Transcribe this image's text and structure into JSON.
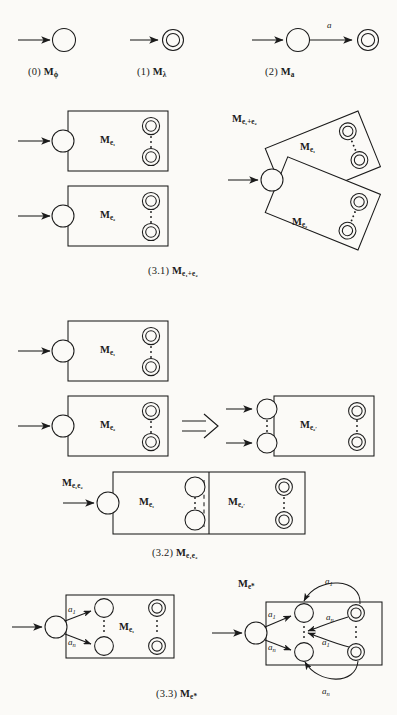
{
  "figure": {
    "ink_color": "#1b1b1b",
    "paper_color": "#fbfaf7"
  },
  "row_base": {
    "items": [
      {
        "index": "(0)",
        "machine": "M",
        "sub": "ϕ",
        "caption_full": "(0) Mϕ"
      },
      {
        "index": "(1)",
        "machine": "M",
        "sub": "λ",
        "caption_full": "(1) Mλ"
      },
      {
        "index": "(2)",
        "machine": "M",
        "sub": "a",
        "caption_full": "(2) Ma",
        "edge_label": "a"
      }
    ]
  },
  "union": {
    "caption_index": "(3.1)",
    "caption_machine": "M",
    "caption_sub": "e₁+e₂",
    "left_box_1_label": "M",
    "left_box_1_sub": "e₁",
    "left_box_2_label": "M",
    "left_box_2_sub": "e₂",
    "result_outer_label": "M",
    "result_outer_sub": "e₁+e₂",
    "result_box_1_label": "M",
    "result_box_1_sub": "e₁",
    "result_box_2_label": "M",
    "result_box_2_sub": "e₂"
  },
  "concat": {
    "caption_index": "(3.2)",
    "caption_machine": "M",
    "caption_sub": "e₁e₂",
    "src_box_1_label": "M",
    "src_box_1_sub": "e₁",
    "src_box_2_label": "M",
    "src_box_2_sub": "e₂",
    "transform_arrow": "⇒",
    "derived_box_label": "M",
    "derived_box_sub": "e₂",
    "derived_box_prime": "′",
    "result_outer_label": "M",
    "result_outer_sub": "e₁e₂",
    "result_left_label": "M",
    "result_left_sub": "e₁",
    "result_right_label": "M",
    "result_right_sub": "e₂",
    "result_right_prime": "′"
  },
  "star": {
    "caption_index": "(3.3)",
    "caption_machine": "M",
    "caption_sub": "e*",
    "src_box_label": "M",
    "src_box_sub": "e₁",
    "result_outer_label": "M",
    "result_outer_sub": "e*",
    "edge_a1": "a",
    "edge_a1_sub": "1",
    "edge_an": "a",
    "edge_an_sub": "n",
    "loop_labels": [
      "a₁",
      "aₙ",
      "a₁",
      "aₙ"
    ]
  }
}
